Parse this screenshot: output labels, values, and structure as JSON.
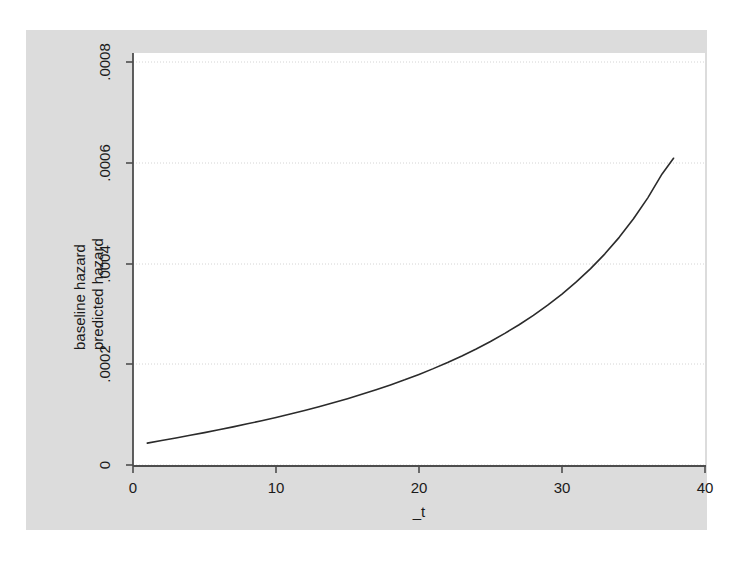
{
  "chart_data": {
    "type": "line",
    "title": "",
    "subtitle": "",
    "xlabel": "_t",
    "ylabel_lines": [
      "baseline hazard",
      "predicted hazard"
    ],
    "ylabel": "baseline hazard predicted hazard",
    "xlim": [
      0,
      41
    ],
    "ylim": [
      0,
      0.00083
    ],
    "xticks": [
      0,
      10,
      20,
      30,
      40
    ],
    "xtick_labels": [
      "0",
      "10",
      "20",
      "30",
      "40"
    ],
    "yticks": [
      0,
      0.0002,
      0.0004,
      0.0006,
      0.0008
    ],
    "ytick_labels": [
      "0",
      ".0002",
      ".0004",
      ".0006",
      ".0008"
    ],
    "grid": "horizontal-dotted",
    "legend": "none",
    "series": [
      {
        "name": "predicted hazard",
        "color": "#2b2b2b",
        "line_width": 1.6,
        "x": [
          1.0,
          2.0,
          3.0,
          4.0,
          5.0,
          6.0,
          7.0,
          8.0,
          9.0,
          10.0,
          11.0,
          12.0,
          13.0,
          14.0,
          15.0,
          16.0,
          17.0,
          18.0,
          19.0,
          20.0,
          21.0,
          22.0,
          23.0,
          24.0,
          25.0,
          26.0,
          27.0,
          28.0,
          29.0,
          30.0,
          31.0,
          32.0,
          33.0,
          34.0,
          35.0,
          36.0,
          37.0,
          37.8
        ],
        "y": [
          4.34e-05,
          4.85e-05,
          5.36e-05,
          5.89e-05,
          6.43e-05,
          6.99e-05,
          7.57e-05,
          8.17e-05,
          8.79e-05,
          9.44e-05,
          0.0001012,
          0.0001083,
          0.0001157,
          0.0001235,
          0.0001317,
          0.0001403,
          0.0001494,
          0.000159,
          0.0001691,
          0.0001799,
          0.0001913,
          0.0002035,
          0.0002165,
          0.0002304,
          0.0002453,
          0.0002613,
          0.0002785,
          0.0002971,
          0.0003173,
          0.0003393,
          0.0003634,
          0.0003899,
          0.0004192,
          0.0004519,
          0.0004887,
          0.0005303,
          0.0005778,
          0.0006089
        ]
      }
    ]
  },
  "colors": {
    "graph_region_background": "#dcdcdc",
    "plot_background": "#ffffff",
    "axis_line": "#4d4d4d",
    "grid_line": "#d0d0d0",
    "series_line": "#2b2b2b",
    "text": "#1a1a1a",
    "page_background": "#ffffff"
  }
}
